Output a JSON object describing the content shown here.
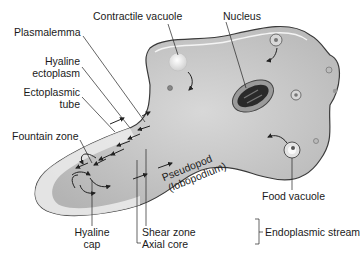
{
  "diagram": {
    "labels": {
      "contractile_vacuole": "Contractile vacuole",
      "nucleus": "Nucleus",
      "plasmalemma": "Plasmalemma",
      "hyaline_ectoplasm_1": "Hyaline",
      "hyaline_ectoplasm_2": "ectoplasm",
      "ectoplasmic_tube_1": "Ectoplasmic",
      "ectoplasmic_tube_2": "tube",
      "fountain_zone": "Fountain zone",
      "food_vacuole": "Food vacuole",
      "pseudopod_1": "Pseudopod",
      "pseudopod_2": "(lobopodium)",
      "hyaline_cap_1": "Hyaline",
      "hyaline_cap_2": "cap",
      "shear_zone": "Shear zone",
      "axial_core": "Axial core",
      "endoplasmic_stream": "Endoplasmic stream"
    },
    "colors": {
      "cell_fill": "#c9c9c9",
      "cell_outline": "#3a3a3a",
      "ectoplasm_fill": "#e6e6e6",
      "nucleus_fill": "#8a8a8a",
      "nucleus_core": "#2a2a2a",
      "leader_line": "#222222"
    }
  }
}
